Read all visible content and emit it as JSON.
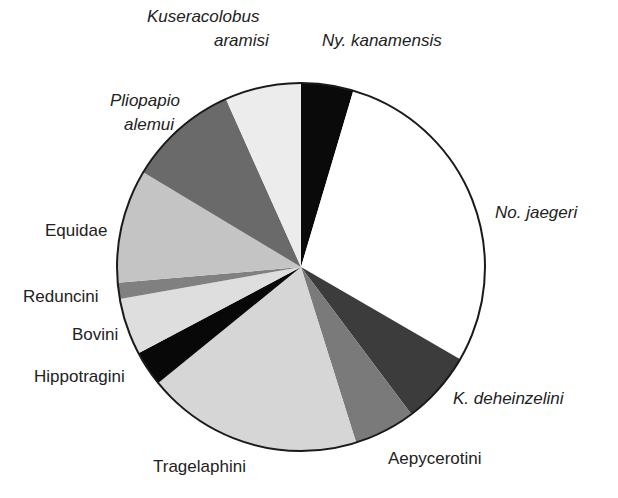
{
  "chart_data": {
    "type": "pie",
    "title": "",
    "start_angle_deg": 0,
    "direction": "clockwise",
    "units": "percent (estimated from slice angles)",
    "slices": [
      {
        "label": "Ny. kanamensis",
        "italic": true,
        "value": 4.6,
        "color": "#0a0a0a"
      },
      {
        "label": "No. jaegeri",
        "italic": true,
        "value": 28.8,
        "color": "#ffffff"
      },
      {
        "label": "K. deheinzelini",
        "italic": true,
        "value": 6.4,
        "color": "#3c3c3c"
      },
      {
        "label": "Aepycerotini",
        "italic": false,
        "value": 5.4,
        "color": "#7a7a7a"
      },
      {
        "label": "Tragelaphini",
        "italic": false,
        "value": 19.0,
        "color": "#d6d6d6"
      },
      {
        "label": "Hippotragini",
        "italic": false,
        "value": 3.1,
        "color": "#080808"
      },
      {
        "label": "Bovini",
        "italic": false,
        "value": 5.0,
        "color": "#dedede"
      },
      {
        "label": "Reduncini",
        "italic": false,
        "value": 1.4,
        "color": "#808080"
      },
      {
        "label": "Equidae",
        "italic": false,
        "value": 10.0,
        "color": "#c4c4c4"
      },
      {
        "label": "Pliopapio alemui",
        "italic": true,
        "value": 9.7,
        "color": "#6a6a6a"
      },
      {
        "label": "Kuseracolobus aramisi",
        "italic": true,
        "value": 6.7,
        "color": "#ececec"
      }
    ],
    "legend": "none (direct labels)"
  },
  "labels": {
    "ny": "Ny. kanamensis",
    "no": "No. jaegeri",
    "kdeh": "K. deheinzelini",
    "aepy": "Aepycerotini",
    "trag": "Tragelaphini",
    "hippo": "Hippotragini",
    "bovini": "Bovini",
    "redun": "Reduncini",
    "equid": "Equidae",
    "plio1": "Pliopapio",
    "plio2": "alemui",
    "kuse1": "Kuseracolobus",
    "kuse2": "aramisi"
  }
}
